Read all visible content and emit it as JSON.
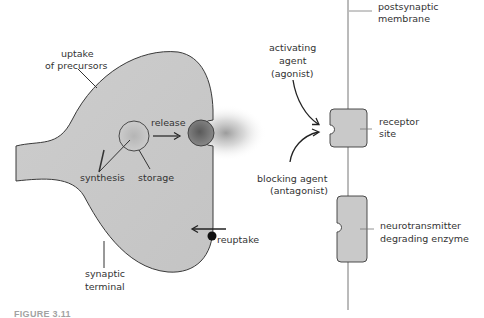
{
  "colors": {
    "cell_fill": "#c8c8c8",
    "outline": "#3a3a3a",
    "text": "#333333",
    "vesicle_release": "#6e6e6e",
    "background": "#ffffff"
  },
  "presynaptic": {
    "labels": {
      "uptake_line1": "uptake",
      "uptake_line2": "of precursors",
      "release": "release",
      "synthesis": "synthesis",
      "storage": "storage",
      "reuptake": "reuptake",
      "terminal_line1": "synaptic",
      "terminal_line2": "terminal"
    }
  },
  "postsynaptic": {
    "labels": {
      "membrane_line1": "postsynaptic",
      "membrane_line2": "membrane",
      "agonist_line1": "activating",
      "agonist_line2": "agent",
      "agonist_line3": "(agonist)",
      "antagonist_line1": "blocking agent",
      "antagonist_line2": "(antagonist)",
      "receptor_line1": "receptor",
      "receptor_line2": "site",
      "enzyme_line1": "neurotransmitter",
      "enzyme_line2": "degrading enzyme"
    }
  },
  "caption": "FIGURE 3.11"
}
